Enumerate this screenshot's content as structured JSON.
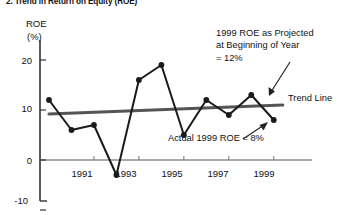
{
  "figure": {
    "title": "2. Trend in Return on Equity (ROE)",
    "y_axis_name": "ROE",
    "y_axis_unit": "(%)"
  },
  "annotations": {
    "projected": {
      "line1": "1999 ROE as Projected",
      "line2": "at Beginning of Year",
      "line3": "= 12%"
    },
    "actual": "Actual 1999 ROE = 8%",
    "trend_line": "Trend Line"
  },
  "chart_data": {
    "type": "line",
    "title": "2. Trend in Return on Equity (ROE)",
    "xlabel": "",
    "ylabel": "ROE (%)",
    "xlim": [
      1988.6,
      1999.9
    ],
    "ylim": [
      -10,
      24
    ],
    "yticks": [
      20,
      10,
      0,
      -10
    ],
    "ytick_labels": [
      "20",
      "10",
      "0",
      "-10"
    ],
    "xticks": [
      1991,
      1993,
      1995,
      1997,
      1999
    ],
    "xtick_labels": [
      "1991",
      "1993",
      "1995",
      "1997",
      "1999"
    ],
    "grid": false,
    "legend": "none",
    "series": [
      {
        "name": "Actual ROE",
        "color": "#1a1a1a",
        "markers": true,
        "x": [
          1989,
          1990,
          1991,
          1992,
          1993,
          1994,
          1995,
          1996,
          1997,
          1998,
          1999
        ],
        "values": [
          12,
          6,
          7,
          -3,
          16,
          19,
          5,
          12,
          9,
          13,
          8
        ]
      },
      {
        "name": "Trend Line",
        "color": "#555555",
        "markers": false,
        "x": [
          1989,
          1999.4
        ],
        "values": [
          9.2,
          11.0
        ]
      }
    ],
    "callouts": [
      {
        "label": "1999 ROE as Projected at Beginning of Year = 12%",
        "value": 12,
        "year": 1999
      },
      {
        "label": "Actual 1999 ROE = 8%",
        "value": 8,
        "year": 1999
      }
    ]
  }
}
